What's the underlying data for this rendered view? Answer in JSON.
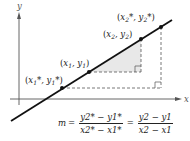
{
  "diagram": {
    "axes": {
      "x_label": "x",
      "y_label": "y"
    },
    "points": [
      {
        "id": "p1_star",
        "label": "(x1*, y1*)",
        "x": 62,
        "y": 88
      },
      {
        "id": "p1",
        "label": "(x1, y1)",
        "x": 89,
        "y": 72
      },
      {
        "id": "p2",
        "label": "(x2, y2)",
        "x": 141,
        "y": 39
      },
      {
        "id": "p2_star",
        "label": "(x2*, y2*)",
        "x": 161,
        "y": 27
      }
    ],
    "line": {
      "x1": 11,
      "y1": 121,
      "x2": 172,
      "y2": 20,
      "color": "#111111"
    },
    "shaded_triangle_color": "#e6e6e6",
    "formula": {
      "lhs": "m",
      "eq": "=",
      "frac1_num": "y2* − y1*",
      "frac1_den": "x2* − x1*",
      "frac2_num": "y2 − y1",
      "frac2_den": "x2 − x1"
    }
  }
}
